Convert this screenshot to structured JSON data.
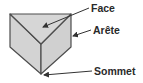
{
  "diagram": {
    "colors": {
      "face_fill": "#d3d3d3",
      "face_fill_side": "#d0d0d0",
      "edge_stroke": "#4d4d4d",
      "arrow_stroke": "#333333",
      "label_text": "#2a2a2a"
    },
    "labels": {
      "face": "Face",
      "edge": "Arête",
      "vertex": "Sommet"
    }
  }
}
